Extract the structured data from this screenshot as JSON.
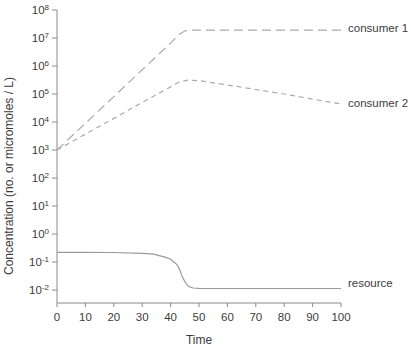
{
  "chart_data": {
    "type": "line",
    "title": "",
    "xlabel": "Time",
    "ylabel": "Concentration (no. or micromoles / L)",
    "x_scale": "linear",
    "y_scale": "log",
    "xlim": [
      0,
      100
    ],
    "ylim": [
      "1e-2",
      "1e8"
    ],
    "grid": false,
    "legend_position": "right-of-plot-inline",
    "x_ticks": [
      0,
      10,
      20,
      30,
      40,
      50,
      60,
      70,
      80,
      90,
      100
    ],
    "y_tick_base": "10",
    "y_tick_exponents": [
      8,
      7,
      6,
      5,
      4,
      3,
      2,
      1,
      0,
      -1,
      -2
    ],
    "series": [
      {
        "name": "consumer 1",
        "line_style": "long-dash",
        "color": "#ababab",
        "x": [
          0,
          10,
          20,
          30,
          40,
          43,
          45,
          48,
          60,
          80,
          100
        ],
        "y": [
          1000,
          9000,
          81000,
          730000,
          6600000,
          13500000,
          18000000,
          19000000,
          19000000,
          19000000,
          19000000
        ]
      },
      {
        "name": "consumer 2",
        "line_style": "short-dash",
        "color": "#ababab",
        "x": [
          0,
          10,
          20,
          30,
          40,
          43,
          46,
          50,
          60,
          70,
          80,
          90,
          100
        ],
        "y": [
          1000,
          3700,
          13500,
          50000,
          180000,
          270000,
          310000,
          300000,
          210000,
          145000,
          100000,
          66000,
          44000
        ]
      },
      {
        "name": "resource",
        "line_style": "solid",
        "color": "#9b9b9b",
        "x": [
          0,
          10,
          20,
          30,
          34,
          38,
          40,
          42,
          43,
          44,
          45,
          46,
          47,
          48,
          50,
          60,
          70,
          80,
          90,
          100
        ],
        "y": [
          0.22,
          0.22,
          0.219,
          0.205,
          0.19,
          0.15,
          0.125,
          0.085,
          0.06,
          0.032,
          0.02,
          0.0145,
          0.0125,
          0.0118,
          0.0114,
          0.0113,
          0.0113,
          0.0113,
          0.0113,
          0.0113
        ]
      }
    ],
    "labels": {
      "series_label_1": "consumer 1",
      "series_label_2": "consumer 2",
      "series_label_3": "resource"
    },
    "colors": {
      "axis": "#8a8a8a",
      "text": "#3c3c3c",
      "curve_dashed": "#ababab",
      "curve_solid": "#9b9b9b"
    }
  }
}
